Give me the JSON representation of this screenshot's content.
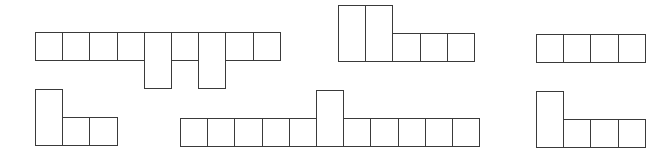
{
  "diagram": {
    "stroke_color": "#3a3a3a",
    "background": "#ffffff",
    "unit": {
      "w": 27.2,
      "h": 28
    },
    "shapes": [
      {
        "id": "shape-1",
        "origin": {
          "x": 35,
          "y": 32
        },
        "cells": [
          {
            "col": 0,
            "row": 0,
            "span": 1
          },
          {
            "col": 1,
            "row": 0,
            "span": 1
          },
          {
            "col": 2,
            "row": 0,
            "span": 1
          },
          {
            "col": 3,
            "row": 0,
            "span": 1
          },
          {
            "col": 4,
            "row": 0,
            "span": 2
          },
          {
            "col": 5,
            "row": 0,
            "span": 1
          },
          {
            "col": 6,
            "row": 0,
            "span": 2
          },
          {
            "col": 7,
            "row": 0,
            "span": 1
          },
          {
            "col": 8,
            "row": 0,
            "span": 1
          }
        ]
      },
      {
        "id": "shape-2",
        "origin": {
          "x": 338,
          "y": 5
        },
        "cells": [
          {
            "col": 0,
            "row": 0,
            "span": 2
          },
          {
            "col": 1,
            "row": 0,
            "span": 2
          },
          {
            "col": 2,
            "row": 1,
            "span": 1
          },
          {
            "col": 3,
            "row": 1,
            "span": 1
          },
          {
            "col": 4,
            "row": 1,
            "span": 1
          }
        ]
      },
      {
        "id": "shape-3",
        "origin": {
          "x": 536,
          "y": 34
        },
        "cells": [
          {
            "col": 0,
            "row": 0,
            "span": 1
          },
          {
            "col": 1,
            "row": 0,
            "span": 1
          },
          {
            "col": 2,
            "row": 0,
            "span": 1
          },
          {
            "col": 3,
            "row": 0,
            "span": 1
          }
        ]
      },
      {
        "id": "shape-4",
        "origin": {
          "x": 35,
          "y": 89
        },
        "cells": [
          {
            "col": 0,
            "row": 0,
            "span": 2
          },
          {
            "col": 1,
            "row": 1,
            "span": 1
          },
          {
            "col": 2,
            "row": 1,
            "span": 1
          }
        ]
      },
      {
        "id": "shape-5",
        "origin": {
          "x": 180,
          "y": 90
        },
        "cells": [
          {
            "col": 0,
            "row": 1,
            "span": 1
          },
          {
            "col": 1,
            "row": 1,
            "span": 1
          },
          {
            "col": 2,
            "row": 1,
            "span": 1
          },
          {
            "col": 3,
            "row": 1,
            "span": 1
          },
          {
            "col": 4,
            "row": 1,
            "span": 1
          },
          {
            "col": 5,
            "row": 0,
            "span": 2
          },
          {
            "col": 6,
            "row": 1,
            "span": 1
          },
          {
            "col": 7,
            "row": 1,
            "span": 1
          },
          {
            "col": 8,
            "row": 1,
            "span": 1
          },
          {
            "col": 9,
            "row": 1,
            "span": 1
          },
          {
            "col": 10,
            "row": 1,
            "span": 1
          }
        ]
      },
      {
        "id": "shape-6",
        "origin": {
          "x": 536,
          "y": 91
        },
        "cells": [
          {
            "col": 0,
            "row": 0,
            "span": 2
          },
          {
            "col": 1,
            "row": 1,
            "span": 1
          },
          {
            "col": 2,
            "row": 1,
            "span": 1
          },
          {
            "col": 3,
            "row": 1,
            "span": 1
          }
        ]
      }
    ]
  }
}
